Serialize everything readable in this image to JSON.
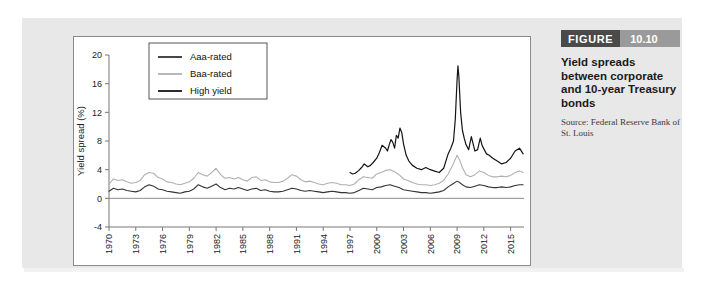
{
  "figure": {
    "label_word": "FIGURE",
    "number": "10.10",
    "title": "Yield spreads between corporate and 10-year Treasury bonds",
    "source": "Source: Federal Reserve Bank of St. Louis",
    "header_dark_color": "#4a4a4a",
    "header_light_color": "#9a9a9a",
    "panel_color": "#e8e8e8"
  },
  "chart_data": {
    "type": "line",
    "title": "",
    "xlabel": "",
    "ylabel": "Yield spread (%)",
    "xlim": [
      1970,
      2016.5
    ],
    "ylim": [
      -4,
      20
    ],
    "yticks": [
      -4,
      0,
      4,
      8,
      12,
      16,
      20
    ],
    "xticks": [
      1970,
      1973,
      1976,
      1979,
      1982,
      1985,
      1988,
      1991,
      1994,
      1997,
      2000,
      2003,
      2006,
      2009,
      2012,
      2015
    ],
    "grid": false,
    "legend_position": "upper-left-inside",
    "zero_line": true,
    "series": [
      {
        "name": "Aaa-rated",
        "color": "#333333",
        "width": 1.1,
        "x": [
          1970.0,
          1970.5,
          1971.0,
          1971.5,
          1972.0,
          1972.5,
          1973.0,
          1973.5,
          1974.0,
          1974.5,
          1975.0,
          1975.5,
          1976.0,
          1976.5,
          1977.0,
          1977.5,
          1978.0,
          1978.5,
          1979.0,
          1979.5,
          1980.0,
          1980.5,
          1981.0,
          1981.5,
          1982.0,
          1982.5,
          1983.0,
          1983.5,
          1984.0,
          1984.5,
          1985.0,
          1985.5,
          1986.0,
          1986.5,
          1987.0,
          1987.5,
          1988.0,
          1988.5,
          1989.0,
          1989.5,
          1990.0,
          1990.5,
          1991.0,
          1991.5,
          1992.0,
          1992.5,
          1993.0,
          1993.5,
          1994.0,
          1994.5,
          1995.0,
          1995.5,
          1996.0,
          1996.5,
          1997.0,
          1997.5,
          1998.0,
          1998.5,
          1999.0,
          1999.5,
          2000.0,
          2000.5,
          2001.0,
          2001.5,
          2002.0,
          2002.5,
          2003.0,
          2003.5,
          2004.0,
          2004.5,
          2005.0,
          2005.5,
          2006.0,
          2006.5,
          2007.0,
          2007.5,
          2008.0,
          2008.5,
          2009.0,
          2009.3,
          2009.6,
          2010.0,
          2010.5,
          2011.0,
          2011.5,
          2012.0,
          2012.5,
          2013.0,
          2013.5,
          2014.0,
          2014.5,
          2015.0,
          2015.5,
          2016.0,
          2016.4
        ],
        "y": [
          1.0,
          1.4,
          1.2,
          1.3,
          1.1,
          1.0,
          0.9,
          1.1,
          1.6,
          1.9,
          1.7,
          1.3,
          1.2,
          1.0,
          0.9,
          0.8,
          0.7,
          0.9,
          1.0,
          1.3,
          1.9,
          1.6,
          1.4,
          1.7,
          2.0,
          1.5,
          1.2,
          1.4,
          1.3,
          1.5,
          1.3,
          1.1,
          1.3,
          1.4,
          1.1,
          1.2,
          1.0,
          0.9,
          0.9,
          1.0,
          1.2,
          1.4,
          1.3,
          1.1,
          1.0,
          1.1,
          1.0,
          0.9,
          0.8,
          0.9,
          1.0,
          0.9,
          0.8,
          0.8,
          0.7,
          0.8,
          1.1,
          1.4,
          1.3,
          1.2,
          1.5,
          1.6,
          1.8,
          1.9,
          1.7,
          1.5,
          1.2,
          1.1,
          1.0,
          0.9,
          0.8,
          0.8,
          0.7,
          0.8,
          0.9,
          1.1,
          1.6,
          2.0,
          2.4,
          2.2,
          1.9,
          1.6,
          1.5,
          1.7,
          1.9,
          1.8,
          1.6,
          1.5,
          1.5,
          1.6,
          1.5,
          1.6,
          1.8,
          1.9,
          1.9
        ]
      },
      {
        "name": "Baa-rated",
        "color": "#b0b0b0",
        "width": 1.1,
        "x": [
          1970.0,
          1970.5,
          1971.0,
          1971.5,
          1972.0,
          1972.5,
          1973.0,
          1973.5,
          1974.0,
          1974.5,
          1975.0,
          1975.5,
          1976.0,
          1976.5,
          1977.0,
          1977.5,
          1978.0,
          1978.5,
          1979.0,
          1979.5,
          1980.0,
          1980.5,
          1981.0,
          1981.5,
          1982.0,
          1982.5,
          1983.0,
          1983.5,
          1984.0,
          1984.5,
          1985.0,
          1985.5,
          1986.0,
          1986.5,
          1987.0,
          1987.5,
          1988.0,
          1988.5,
          1989.0,
          1989.5,
          1990.0,
          1990.5,
          1991.0,
          1991.5,
          1992.0,
          1992.5,
          1993.0,
          1993.5,
          1994.0,
          1994.5,
          1995.0,
          1995.5,
          1996.0,
          1996.5,
          1997.0,
          1997.5,
          1998.0,
          1998.5,
          1999.0,
          1999.5,
          2000.0,
          2000.5,
          2001.0,
          2001.5,
          2002.0,
          2002.5,
          2003.0,
          2003.5,
          2004.0,
          2004.5,
          2005.0,
          2005.5,
          2006.0,
          2006.5,
          2007.0,
          2007.5,
          2008.0,
          2008.5,
          2009.0,
          2009.3,
          2009.6,
          2010.0,
          2010.5,
          2011.0,
          2011.5,
          2012.0,
          2012.5,
          2013.0,
          2013.5,
          2014.0,
          2014.5,
          2015.0,
          2015.5,
          2016.0,
          2016.4
        ],
        "y": [
          2.0,
          2.7,
          2.5,
          2.6,
          2.3,
          2.1,
          2.2,
          2.5,
          3.3,
          3.6,
          3.5,
          2.9,
          2.7,
          2.3,
          2.2,
          2.0,
          1.9,
          2.1,
          2.3,
          2.8,
          3.6,
          3.3,
          3.1,
          3.6,
          4.2,
          3.3,
          2.8,
          2.9,
          2.7,
          2.9,
          2.6,
          2.4,
          2.9,
          3.0,
          2.5,
          2.6,
          2.3,
          2.2,
          2.2,
          2.4,
          2.8,
          3.3,
          3.1,
          2.6,
          2.3,
          2.4,
          2.2,
          2.0,
          1.9,
          2.1,
          2.2,
          2.1,
          1.9,
          1.9,
          1.8,
          2.0,
          2.6,
          3.0,
          2.9,
          2.8,
          3.4,
          3.6,
          3.9,
          4.0,
          3.7,
          3.3,
          2.7,
          2.5,
          2.2,
          2.0,
          1.9,
          1.9,
          1.8,
          1.9,
          2.1,
          2.5,
          3.4,
          4.6,
          6.0,
          5.3,
          4.3,
          3.3,
          3.0,
          3.3,
          3.8,
          3.6,
          3.2,
          3.0,
          3.0,
          3.1,
          3.0,
          3.2,
          3.6,
          3.8,
          3.6
        ]
      },
      {
        "name": "High yield",
        "color": "#141414",
        "width": 1.2,
        "x": [
          1997.0,
          1997.3,
          1997.6,
          1998.0,
          1998.3,
          1998.6,
          1999.0,
          1999.3,
          1999.6,
          2000.0,
          2000.3,
          2000.6,
          2001.0,
          2001.2,
          2001.4,
          2001.6,
          2001.8,
          2002.0,
          2002.2,
          2002.4,
          2002.6,
          2002.8,
          2003.0,
          2003.3,
          2003.6,
          2004.0,
          2004.5,
          2005.0,
          2005.5,
          2006.0,
          2006.5,
          2007.0,
          2007.5,
          2008.0,
          2008.3,
          2008.6,
          2008.8,
          2009.0,
          2009.1,
          2009.2,
          2009.4,
          2009.6,
          2009.8,
          2010.0,
          2010.3,
          2010.6,
          2011.0,
          2011.3,
          2011.6,
          2011.8,
          2012.0,
          2012.3,
          2012.6,
          2013.0,
          2013.5,
          2014.0,
          2014.5,
          2015.0,
          2015.5,
          2016.0,
          2016.4
        ],
        "y": [
          3.6,
          3.4,
          3.5,
          3.9,
          4.3,
          4.8,
          4.4,
          4.6,
          5.0,
          5.6,
          6.4,
          7.4,
          7.0,
          6.6,
          7.5,
          8.2,
          7.8,
          7.0,
          8.8,
          8.4,
          9.8,
          9.2,
          7.6,
          6.0,
          5.2,
          4.6,
          4.2,
          4.0,
          4.3,
          4.0,
          3.8,
          3.6,
          4.2,
          6.2,
          7.0,
          8.0,
          11.0,
          16.5,
          18.5,
          17.0,
          12.0,
          9.5,
          8.4,
          7.5,
          6.8,
          8.6,
          6.6,
          6.8,
          8.4,
          7.4,
          6.9,
          6.2,
          6.0,
          5.6,
          5.2,
          4.8,
          5.0,
          5.6,
          6.6,
          7.0,
          6.2
        ]
      }
    ]
  },
  "legend": {
    "items": [
      {
        "label": "Aaa-rated",
        "color": "#333333"
      },
      {
        "label": "Baa-rated",
        "color": "#b0b0b0"
      },
      {
        "label": "High yield",
        "color": "#141414"
      }
    ]
  }
}
